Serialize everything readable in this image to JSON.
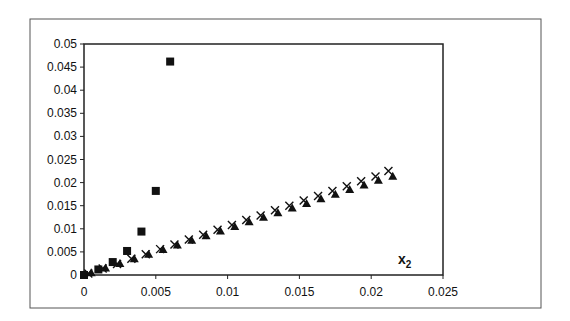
{
  "chart_data": {
    "type": "scatter",
    "title": "",
    "xlabel": "x2",
    "xlabel_main": "x",
    "xlabel_sub": "2",
    "ylabel": "",
    "xlim": [
      0,
      0.025
    ],
    "ylim": [
      0,
      0.05
    ],
    "grid": false,
    "legend": null,
    "x_ticks": [
      0,
      0.005,
      0.01,
      0.015,
      0.02,
      0.025
    ],
    "x_tick_labels": [
      "0",
      "0.005",
      "0.01",
      "0.015",
      "0.02",
      "0.025"
    ],
    "y_ticks": [
      0,
      0.005,
      0.01,
      0.015,
      0.02,
      0.025,
      0.03,
      0.035,
      0.04,
      0.045,
      0.05
    ],
    "y_tick_labels": [
      "0",
      "0.005",
      "0.01",
      "0.015",
      "0.02",
      "0.025",
      "0.03",
      "0.035",
      "0.04",
      "0.045",
      "0.05"
    ],
    "series": [
      {
        "name": "squares",
        "marker": "square",
        "color": "#111111",
        "x": [
          0,
          0.001,
          0.002,
          0.003,
          0.004,
          0.005,
          0.006
        ],
        "y": [
          0,
          0.0012,
          0.0028,
          0.0052,
          0.0094,
          0.0182,
          0.0462
        ]
      },
      {
        "name": "crosses",
        "marker": "x",
        "color": "#111111",
        "x": [
          0.0003,
          0.0013,
          0.0023,
          0.0033,
          0.0043,
          0.0053,
          0.0063,
          0.0073,
          0.0083,
          0.0093,
          0.0103,
          0.0113,
          0.0123,
          0.0133,
          0.0143,
          0.0153,
          0.0163,
          0.0173,
          0.0183,
          0.0193,
          0.0203,
          0.0212
        ],
        "y": [
          0.0003,
          0.0014,
          0.0024,
          0.0035,
          0.0045,
          0.0056,
          0.0066,
          0.0077,
          0.0087,
          0.0098,
          0.0108,
          0.0119,
          0.0129,
          0.014,
          0.015,
          0.0161,
          0.0171,
          0.0182,
          0.0192,
          0.0203,
          0.0213,
          0.0225
        ]
      },
      {
        "name": "triangles",
        "marker": "triangle",
        "color": "#111111",
        "x": [
          0.0005,
          0.0015,
          0.0025,
          0.0035,
          0.0045,
          0.0055,
          0.0065,
          0.0075,
          0.0085,
          0.0095,
          0.0105,
          0.0115,
          0.0125,
          0.0135,
          0.0145,
          0.0155,
          0.0165,
          0.0175,
          0.0185,
          0.0195,
          0.0205,
          0.0215
        ],
        "y": [
          0.0005,
          0.0015,
          0.0025,
          0.0035,
          0.0045,
          0.0055,
          0.0065,
          0.0075,
          0.0085,
          0.0095,
          0.0105,
          0.0115,
          0.0125,
          0.0135,
          0.0145,
          0.0155,
          0.0165,
          0.0175,
          0.0185,
          0.0195,
          0.0205,
          0.0214
        ]
      }
    ]
  },
  "layout": {
    "frame": {
      "x": 30,
      "y": 19,
      "w": 511,
      "h": 289
    },
    "plot": {
      "left": 84,
      "top": 44,
      "right": 443,
      "bottom": 275
    },
    "axis_color": "#222222",
    "frame_color": "#555555"
  }
}
